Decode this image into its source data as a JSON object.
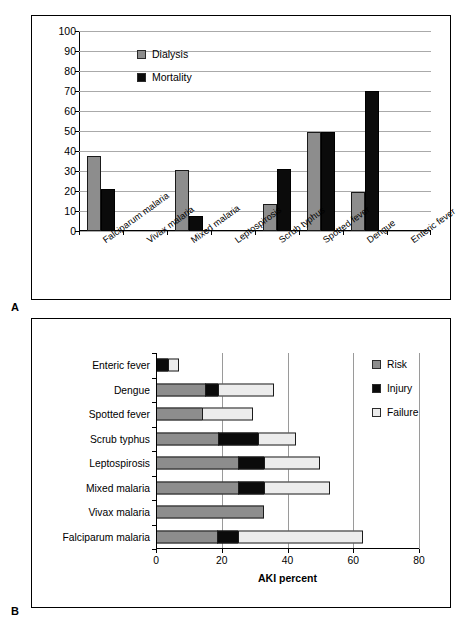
{
  "figure": {
    "panel_a_letter": "A",
    "panel_b_letter": "B"
  },
  "chart_data": [
    {
      "id": "panel_a",
      "type": "bar",
      "title": "",
      "xlabel": "",
      "ylabel": "",
      "ylim": [
        0,
        100
      ],
      "ytick_labels": [
        "100",
        "90",
        "80",
        "70",
        "60",
        "50",
        "40",
        "30",
        "20",
        "10",
        "0"
      ],
      "yticks": [
        100,
        90,
        80,
        70,
        60,
        50,
        40,
        30,
        20,
        10,
        0
      ],
      "grid": true,
      "legend_position": "inside-top-left",
      "legend": [
        "Dialysis",
        "Mortality"
      ],
      "colors": {
        "Dialysis": "#8d8d8d",
        "Mortality": "#0b0b0b"
      },
      "categories": [
        "Falciparum malaria",
        "Vivax malaria",
        "Mixed malaria",
        "Leptospirosis",
        "Scrub typhus",
        "Spotted fever",
        "Dengue",
        "Enteric fever"
      ],
      "series": [
        {
          "name": "Dialysis",
          "values": [
            37.5,
            0,
            30.5,
            0,
            13.5,
            49.5,
            19.5,
            0
          ]
        },
        {
          "name": "Mortality",
          "values": [
            21,
            0,
            7.5,
            0,
            31,
            49.5,
            70,
            0
          ]
        }
      ]
    },
    {
      "id": "panel_b",
      "type": "bar",
      "orientation": "horizontal",
      "stacked": true,
      "title": "",
      "xlabel": "AKI percent",
      "ylabel": "",
      "xlim": [
        0,
        80
      ],
      "xtick_labels": [
        "0",
        "20",
        "40",
        "60",
        "80"
      ],
      "xticks": [
        0,
        20,
        40,
        60,
        80
      ],
      "grid": true,
      "legend_position": "right",
      "legend": [
        "Risk",
        "Injury",
        "Failure"
      ],
      "colors": {
        "Risk": "#8d8d8d",
        "Injury": "#0b0b0b",
        "Failure": "#ececec"
      },
      "categories": [
        "Enteric fever",
        "Dengue",
        "Spotted fever",
        "Scrub typhus",
        "Leptospirosis",
        "Mixed malaria",
        "Vivax malaria",
        "Falciparum malaria"
      ],
      "series": [
        {
          "name": "Risk",
          "values": [
            0,
            15,
            14,
            19,
            25,
            25,
            33,
            18.5
          ]
        },
        {
          "name": "Injury",
          "values": [
            3.5,
            4,
            0,
            12,
            8,
            8,
            0,
            6.5
          ]
        },
        {
          "name": "Failure",
          "values": [
            3.5,
            17,
            15.5,
            11.5,
            17,
            20,
            0,
            38
          ]
        }
      ],
      "totals": [
        7,
        36,
        29.5,
        42.5,
        50,
        53,
        33,
        63
      ]
    }
  ]
}
